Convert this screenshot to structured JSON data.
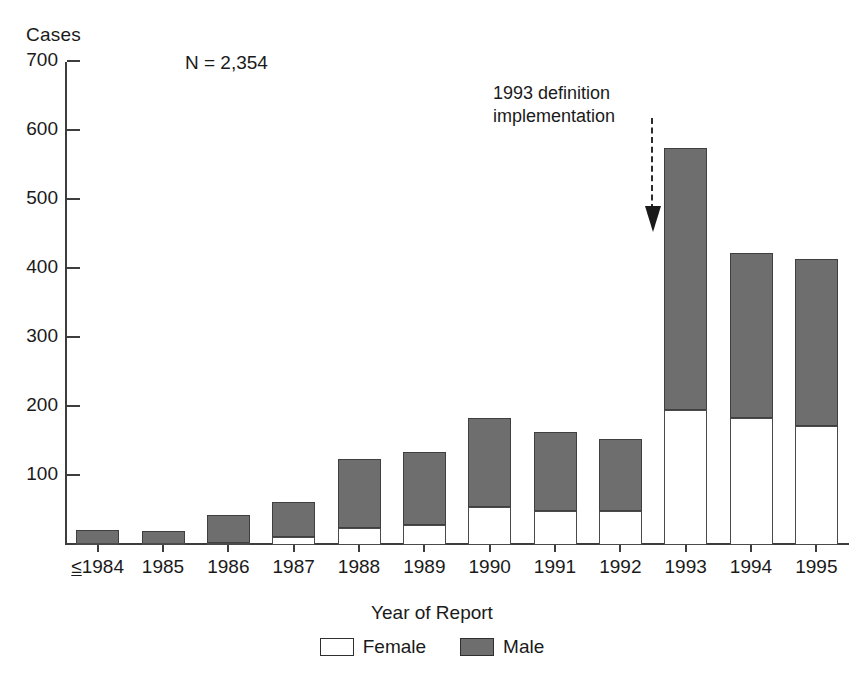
{
  "chart_data": {
    "type": "bar",
    "subtype": "stacked-vertical",
    "title": "",
    "xlabel": "Year of Report",
    "ylabel": "Cases",
    "ylim": [
      0,
      700
    ],
    "yticks": [
      0,
      100,
      200,
      300,
      400,
      500,
      600,
      700
    ],
    "ytick_labels": [
      "",
      "100",
      "200",
      "300",
      "400",
      "500",
      "600",
      "700"
    ],
    "grid": false,
    "legend_position": "bottom-center",
    "categories": [
      "≤1984",
      "1985",
      "1986",
      "1987",
      "1988",
      "1989",
      "1990",
      "1991",
      "1992",
      "1993",
      "1994",
      "1995"
    ],
    "series": [
      {
        "name": "Female",
        "color": "#ffffff",
        "values": [
          2,
          1,
          3,
          12,
          25,
          29,
          55,
          49,
          49,
          196,
          184,
          172
        ]
      },
      {
        "name": "Male",
        "color": "#6e6e6e",
        "values": [
          20,
          19,
          40,
          50,
          100,
          106,
          129,
          115,
          105,
          379,
          239,
          242
        ]
      }
    ],
    "totals": [
      22,
      20,
      43,
      62,
      125,
      135,
      184,
      164,
      154,
      575,
      423,
      414
    ],
    "annotations": [
      {
        "text": "N = 2,354",
        "name": "sample-size-annotation"
      },
      {
        "text_line1": "1993 definition",
        "text_line2": "implementation",
        "name": "definition-change-callout",
        "arrow": "down-dashed",
        "points_to": "1993"
      }
    ]
  },
  "axis": {
    "y_title": "Cases",
    "x_title": "Year of Report",
    "y_ticks": [
      {
        "value": 700,
        "label": "700"
      },
      {
        "value": 600,
        "label": "600"
      },
      {
        "value": 500,
        "label": "500"
      },
      {
        "value": 400,
        "label": "400"
      },
      {
        "value": 300,
        "label": "300"
      },
      {
        "value": 200,
        "label": "200"
      },
      {
        "value": 100,
        "label": "100"
      },
      {
        "value": 0,
        "label": ""
      }
    ]
  },
  "annotations": {
    "sample_size": "N = 2,354",
    "callout_line1": "1993 definition",
    "callout_line2": "implementation"
  },
  "x_labels": [
    {
      "prefix": "≤",
      "text": "1984",
      "underline_prefix": true
    },
    {
      "prefix": "",
      "text": "1985",
      "underline_prefix": false
    },
    {
      "prefix": "",
      "text": "1986",
      "underline_prefix": false
    },
    {
      "prefix": "",
      "text": "1987",
      "underline_prefix": false
    },
    {
      "prefix": "",
      "text": "1988",
      "underline_prefix": false
    },
    {
      "prefix": "",
      "text": "1989",
      "underline_prefix": false
    },
    {
      "prefix": "",
      "text": "1990",
      "underline_prefix": false
    },
    {
      "prefix": "",
      "text": "1991",
      "underline_prefix": false
    },
    {
      "prefix": "",
      "text": "1992",
      "underline_prefix": false
    },
    {
      "prefix": "",
      "text": "1993",
      "underline_prefix": false
    },
    {
      "prefix": "",
      "text": "1994",
      "underline_prefix": false
    },
    {
      "prefix": "",
      "text": "1995",
      "underline_prefix": false
    }
  ],
  "legend": {
    "items": [
      {
        "label": "Female",
        "swatch": "female"
      },
      {
        "label": "Male",
        "swatch": "male"
      }
    ]
  },
  "colors": {
    "male_fill": "#6e6e6e",
    "female_fill": "#ffffff",
    "bar_stroke": "#3f3f3f",
    "axis": "#3d3d3d",
    "text": "#1a1a1a"
  }
}
